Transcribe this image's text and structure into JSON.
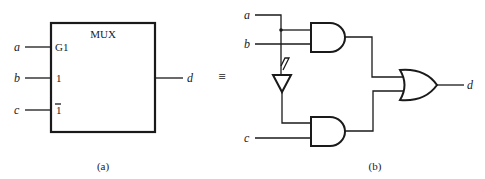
{
  "figure_a": {
    "title": "MUX",
    "caption": "(a)",
    "inputs": [
      {
        "signal": "a",
        "pin": "G1"
      },
      {
        "signal": "b",
        "pin": "1"
      },
      {
        "signal": "c",
        "pin": "1"
      }
    ],
    "output": {
      "signal": "d"
    }
  },
  "equivalence": "≡",
  "figure_b": {
    "caption": "(b)",
    "inputs": {
      "a": "a",
      "b": "b",
      "c": "c"
    },
    "output": "d",
    "gates": [
      "AND",
      "AND",
      "NOT",
      "OR"
    ]
  }
}
